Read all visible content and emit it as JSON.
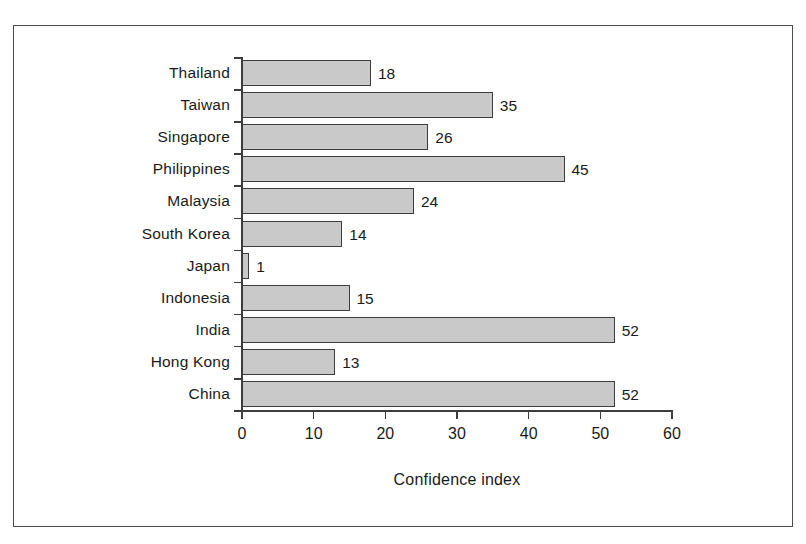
{
  "chart_data": {
    "type": "bar",
    "orientation": "horizontal",
    "title": "",
    "subtitle": "",
    "xlabel": "Confidence index",
    "ylabel": "",
    "xlim": [
      0,
      60
    ],
    "xticks": [
      0,
      10,
      20,
      30,
      40,
      50,
      60
    ],
    "xtick_labels": [
      "0",
      "10",
      "20",
      "30",
      "40",
      "50",
      "60"
    ],
    "grid": false,
    "legend": null,
    "bar_fill_color": "#c9c9c9",
    "bar_edge_color": "#3d3d3d",
    "frame_color": "#4a4a4a",
    "background_color": "#ffffff",
    "value_labels_shown": true,
    "categories": [
      "Thailand",
      "Taiwan",
      "Singapore",
      "Philippines",
      "Malaysia",
      "South Korea",
      "Japan",
      "Indonesia",
      "India",
      "Hong Kong",
      "China"
    ],
    "values": [
      18,
      35,
      26,
      45,
      24,
      14,
      1,
      15,
      52,
      13,
      52
    ],
    "bars": [
      {
        "category": "Thailand",
        "value": 18,
        "label": "18"
      },
      {
        "category": "Taiwan",
        "value": 35,
        "label": "35"
      },
      {
        "category": "Singapore",
        "value": 26,
        "label": "26"
      },
      {
        "category": "Philippines",
        "value": 45,
        "label": "45"
      },
      {
        "category": "Malaysia",
        "value": 24,
        "label": "24"
      },
      {
        "category": "South Korea",
        "value": 14,
        "label": "14"
      },
      {
        "category": "Japan",
        "value": 1,
        "label": "1"
      },
      {
        "category": "Indonesia",
        "value": 15,
        "label": "15"
      },
      {
        "category": "India",
        "value": 52,
        "label": "52"
      },
      {
        "category": "Hong Kong",
        "value": 13,
        "label": "13"
      },
      {
        "category": "China",
        "value": 52,
        "label": "52"
      }
    ]
  }
}
